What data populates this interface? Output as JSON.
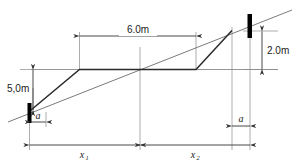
{
  "figure": {
    "type": "engineering-dimension-diagram",
    "background_color": "#ffffff",
    "line_color": "#555555",
    "heavy_line_color": "#333333",
    "post_color": "#000000",
    "text_color": "#1a1a1a"
  },
  "dimensions": {
    "span_top": {
      "label": "6.0m",
      "orientation": "horizontal",
      "value": 6.0,
      "unit": "m"
    },
    "height_left": {
      "label": "5,0m",
      "orientation": "vertical",
      "value": 5.0,
      "unit": "m"
    },
    "height_right": {
      "label": "2.0m",
      "orientation": "vertical",
      "value": 2.0,
      "unit": "m"
    },
    "offset_left": {
      "label": "a",
      "orientation": "horizontal"
    },
    "offset_right": {
      "label": "a",
      "orientation": "horizontal"
    },
    "baseline_left": {
      "label": "x",
      "subscript": "1",
      "orientation": "horizontal"
    },
    "baseline_right": {
      "label": "x",
      "subscript": "2",
      "orientation": "horizontal"
    }
  },
  "elements": {
    "post_left_name": "left-post",
    "post_right_name": "right-post",
    "cable_name": "cable-profile",
    "sight_line_name": "sight-line",
    "reference_line_name": "horizontal-reference-line"
  }
}
